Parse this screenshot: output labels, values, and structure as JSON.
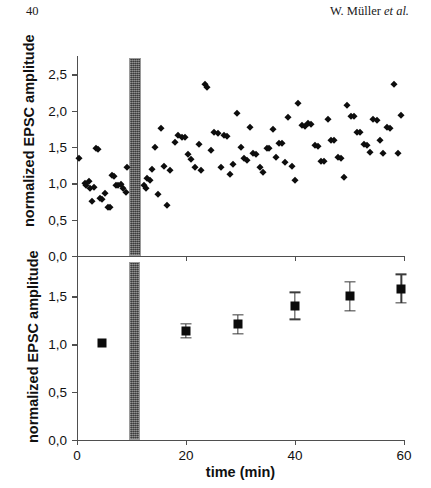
{
  "page": {
    "folio": "40",
    "authors_prefix": "W. Müller ",
    "authors_etal": "et al."
  },
  "colors": {
    "axis": "#4f4f4f",
    "marker": "#0d0d0d",
    "stim_bar": "#5c5c5c",
    "background": "#ffffff"
  },
  "chart_data": [
    {
      "type": "scatter",
      "panel": "top",
      "title": "",
      "xlabel": "",
      "ylabel": "normalized EPSC amplitude",
      "xlim": [
        0,
        60
      ],
      "ylim": [
        0.0,
        2.75
      ],
      "ytick_labels": [
        "2,5",
        "2,0",
        "1,5",
        "1,0",
        "0,5",
        "0,0"
      ],
      "ytick_values": [
        2.5,
        2.0,
        1.5,
        1.0,
        0.5,
        0.0
      ],
      "xtick_values": [
        0,
        20,
        40,
        60
      ],
      "xtick_labels": [
        "",
        "",
        "",
        ""
      ],
      "grid": false,
      "legend": "none",
      "annotations": [
        {
          "name": "stimulation-bar",
          "type": "vertical-band",
          "x_start": 9.5,
          "x_end": 11.7,
          "fill": "gray-hatched"
        }
      ],
      "points": [
        {
          "x": 0.4,
          "y": 1.35
        },
        {
          "x": 1.5,
          "y": 1.0
        },
        {
          "x": 1.7,
          "y": 0.97
        },
        {
          "x": 2.2,
          "y": 1.03
        },
        {
          "x": 2.4,
          "y": 0.93
        },
        {
          "x": 2.7,
          "y": 0.75
        },
        {
          "x": 3.1,
          "y": 0.95
        },
        {
          "x": 3.4,
          "y": 1.48
        },
        {
          "x": 3.9,
          "y": 1.47
        },
        {
          "x": 4.3,
          "y": 0.8
        },
        {
          "x": 4.6,
          "y": 0.79
        },
        {
          "x": 5.2,
          "y": 0.86
        },
        {
          "x": 5.6,
          "y": 0.68
        },
        {
          "x": 6.0,
          "y": 0.67
        },
        {
          "x": 6.4,
          "y": 1.11
        },
        {
          "x": 6.8,
          "y": 1.1
        },
        {
          "x": 7.2,
          "y": 0.98
        },
        {
          "x": 7.6,
          "y": 0.97
        },
        {
          "x": 8.0,
          "y": 0.99
        },
        {
          "x": 8.4,
          "y": 0.93
        },
        {
          "x": 8.9,
          "y": 0.88
        },
        {
          "x": 9.1,
          "y": 1.22
        },
        {
          "x": 12.3,
          "y": 0.97
        },
        {
          "x": 12.6,
          "y": 0.94
        },
        {
          "x": 12.9,
          "y": 1.07
        },
        {
          "x": 13.4,
          "y": 1.05
        },
        {
          "x": 13.8,
          "y": 1.2
        },
        {
          "x": 14.4,
          "y": 1.5
        },
        {
          "x": 14.9,
          "y": 0.85
        },
        {
          "x": 15.4,
          "y": 1.76
        },
        {
          "x": 16.0,
          "y": 1.24
        },
        {
          "x": 16.6,
          "y": 0.7
        },
        {
          "x": 17.1,
          "y": 1.18
        },
        {
          "x": 17.9,
          "y": 1.57
        },
        {
          "x": 18.6,
          "y": 1.66
        },
        {
          "x": 19.2,
          "y": 1.64
        },
        {
          "x": 19.8,
          "y": 1.63
        },
        {
          "x": 20.4,
          "y": 1.4
        },
        {
          "x": 21.0,
          "y": 1.33
        },
        {
          "x": 21.7,
          "y": 1.22
        },
        {
          "x": 22.3,
          "y": 1.54
        },
        {
          "x": 22.8,
          "y": 1.18
        },
        {
          "x": 23.4,
          "y": 2.36
        },
        {
          "x": 23.9,
          "y": 2.33
        },
        {
          "x": 24.6,
          "y": 1.46
        },
        {
          "x": 25.2,
          "y": 1.7
        },
        {
          "x": 25.9,
          "y": 1.69
        },
        {
          "x": 26.4,
          "y": 1.22
        },
        {
          "x": 26.9,
          "y": 1.66
        },
        {
          "x": 27.5,
          "y": 1.65
        },
        {
          "x": 28.0,
          "y": 1.13
        },
        {
          "x": 28.7,
          "y": 1.27
        },
        {
          "x": 29.3,
          "y": 1.97
        },
        {
          "x": 30.0,
          "y": 1.5
        },
        {
          "x": 30.6,
          "y": 1.35
        },
        {
          "x": 31.2,
          "y": 1.32
        },
        {
          "x": 31.7,
          "y": 1.78
        },
        {
          "x": 32.3,
          "y": 1.41
        },
        {
          "x": 32.9,
          "y": 1.4
        },
        {
          "x": 33.5,
          "y": 1.23
        },
        {
          "x": 34.1,
          "y": 1.15
        },
        {
          "x": 34.8,
          "y": 1.49
        },
        {
          "x": 35.3,
          "y": 1.48
        },
        {
          "x": 35.9,
          "y": 1.74
        },
        {
          "x": 36.5,
          "y": 1.36
        },
        {
          "x": 37.1,
          "y": 1.56
        },
        {
          "x": 37.6,
          "y": 1.55
        },
        {
          "x": 38.2,
          "y": 1.29
        },
        {
          "x": 38.8,
          "y": 1.91
        },
        {
          "x": 39.4,
          "y": 1.24
        },
        {
          "x": 40.0,
          "y": 1.04
        },
        {
          "x": 40.6,
          "y": 2.1
        },
        {
          "x": 41.2,
          "y": 1.8
        },
        {
          "x": 41.8,
          "y": 1.79
        },
        {
          "x": 42.4,
          "y": 1.83
        },
        {
          "x": 43.0,
          "y": 1.82
        },
        {
          "x": 43.6,
          "y": 1.52
        },
        {
          "x": 44.2,
          "y": 1.51
        },
        {
          "x": 44.8,
          "y": 1.31
        },
        {
          "x": 45.4,
          "y": 1.3
        },
        {
          "x": 46.0,
          "y": 1.88
        },
        {
          "x": 46.6,
          "y": 1.6
        },
        {
          "x": 47.2,
          "y": 1.59
        },
        {
          "x": 47.8,
          "y": 1.36
        },
        {
          "x": 48.4,
          "y": 1.35
        },
        {
          "x": 49.0,
          "y": 1.09
        },
        {
          "x": 49.6,
          "y": 2.08
        },
        {
          "x": 50.2,
          "y": 1.93
        },
        {
          "x": 50.8,
          "y": 1.92
        },
        {
          "x": 51.4,
          "y": 1.71
        },
        {
          "x": 52.0,
          "y": 1.7
        },
        {
          "x": 52.6,
          "y": 1.54
        },
        {
          "x": 53.2,
          "y": 1.53
        },
        {
          "x": 53.8,
          "y": 1.43
        },
        {
          "x": 54.4,
          "y": 1.88
        },
        {
          "x": 55.0,
          "y": 1.87
        },
        {
          "x": 55.6,
          "y": 1.6
        },
        {
          "x": 56.2,
          "y": 1.42
        },
        {
          "x": 56.8,
          "y": 1.77
        },
        {
          "x": 57.5,
          "y": 1.76
        },
        {
          "x": 58.2,
          "y": 2.36
        },
        {
          "x": 58.9,
          "y": 1.41
        },
        {
          "x": 59.5,
          "y": 1.94
        }
      ]
    },
    {
      "type": "scatter",
      "panel": "bottom",
      "title": "",
      "xlabel": "time (min)",
      "ylabel": "normalized EPSC amplitude",
      "xlim": [
        0,
        60
      ],
      "ylim": [
        0.0,
        1.9
      ],
      "ytick_labels": [
        "1,5",
        "1,0",
        "0,5",
        "0,0"
      ],
      "ytick_values": [
        1.5,
        1.0,
        0.5,
        0.0
      ],
      "xtick_values": [
        0,
        20,
        40,
        60
      ],
      "xtick_labels": [
        "0",
        "20",
        "40",
        "60"
      ],
      "grid": false,
      "legend": "none",
      "annotations": [
        {
          "name": "stimulation-bar",
          "type": "vertical-band",
          "x_start": 9.5,
          "x_end": 11.5,
          "fill": "gray-hatched"
        }
      ],
      "series": [
        {
          "name": "mean normalized EPSC amplitude",
          "marker": "filled-square",
          "errorbar": "SEM",
          "points": [
            {
              "x": 4.5,
              "y": 1.01,
              "err": 0.02
            },
            {
              "x": 20.0,
              "y": 1.14,
              "err": 0.07
            },
            {
              "x": 29.5,
              "y": 1.21,
              "err": 0.1
            },
            {
              "x": 40.0,
              "y": 1.4,
              "err": 0.14
            },
            {
              "x": 50.0,
              "y": 1.5,
              "err": 0.15
            },
            {
              "x": 59.5,
              "y": 1.58,
              "err": 0.15
            }
          ]
        }
      ]
    }
  ]
}
